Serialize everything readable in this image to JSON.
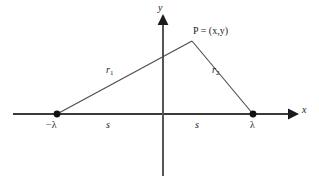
{
  "figure": {
    "background_color": "#ffffff",
    "stroke_color": "#3a3a3a",
    "text_color": "#1a1a1a",
    "axes": {
      "y_label": "y",
      "x_label": "x",
      "origin": {
        "x": 163,
        "y": 114
      },
      "x_axis_start": {
        "x": 13,
        "y": 114
      },
      "x_axis_end": {
        "x": 297,
        "y": 114
      },
      "y_axis_top": {
        "x": 163,
        "y": 16
      },
      "y_axis_bottom": {
        "x": 163,
        "y": 176
      }
    },
    "points": {
      "apex": {
        "label": "P = (x,y)",
        "x": 192,
        "y": 41
      },
      "left_focus": {
        "label": "−λ",
        "x": 57,
        "y": 114
      },
      "right_focus": {
        "label": "λ",
        "x": 253,
        "y": 114
      }
    },
    "segments": [
      {
        "name": "r1",
        "label": "r",
        "subscript": "1",
        "from": "left_focus",
        "to": "apex"
      },
      {
        "name": "r2",
        "label": "r",
        "subscript": "2",
        "from": "apex",
        "to": "right_focus"
      }
    ],
    "baseline_labels": {
      "left": "s",
      "right": "s"
    }
  }
}
